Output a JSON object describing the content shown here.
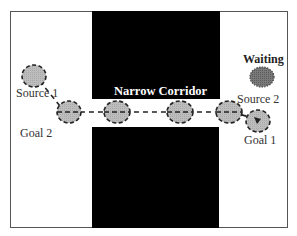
{
  "diagram": {
    "title": "Narrow Corridor",
    "labels": {
      "corridor": "Narrow Corridor",
      "waiting": "Waiting",
      "source1": "Source 1",
      "source2": "Source 2",
      "goal1": "Goal 1",
      "goal2": "Goal 2"
    },
    "colors": {
      "wall": "#000000",
      "robot_fill": "#c0c0c0",
      "robot_outline": "#222222",
      "waiting_fill": "#707070",
      "frame": "#555555",
      "path": "#222222"
    },
    "nodes": [
      {
        "id": "source1-robot",
        "role": "moving robot at Source 1"
      },
      {
        "id": "path-robot-1",
        "role": "moving robot along path"
      },
      {
        "id": "path-robot-2",
        "role": "moving robot in corridor"
      },
      {
        "id": "path-robot-3",
        "role": "moving robot in corridor"
      },
      {
        "id": "path-robot-4",
        "role": "moving robot along path"
      },
      {
        "id": "goal1-robot",
        "role": "moving robot arriving at Goal 1"
      },
      {
        "id": "waiting-robot",
        "role": "waiting robot at Source 2"
      }
    ],
    "edges": [
      {
        "from": "source1-robot",
        "to": "path-robot-1",
        "style": "dashed"
      },
      {
        "from": "path-robot-1",
        "to": "path-robot-2",
        "style": "dashed"
      },
      {
        "from": "path-robot-2",
        "to": "path-robot-3",
        "style": "dashed"
      },
      {
        "from": "path-robot-3",
        "to": "path-robot-4",
        "style": "dashed"
      },
      {
        "from": "path-robot-4",
        "to": "goal1-robot",
        "style": "dashed"
      }
    ]
  }
}
